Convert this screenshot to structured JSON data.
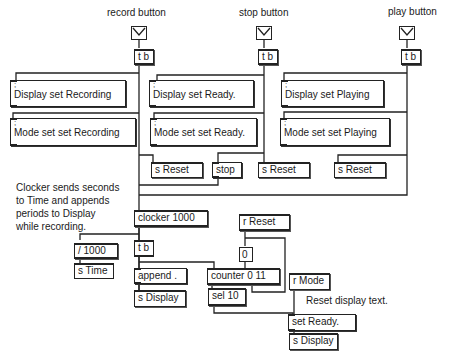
{
  "labels": {
    "record": "record  button",
    "stop": "stop  button",
    "play": "play  button"
  },
  "comments": {
    "clocker_note": [
      "Clocker sends seconds",
      "to Time and appends",
      "periods to Display",
      "while  recording."
    ],
    "reset_note": "Reset  display  text."
  },
  "objects": {
    "tb_record": "t b",
    "tb_stop": "t b",
    "tb_play": "t b",
    "sreset_1": "s Reset",
    "stop_msg": "stop",
    "sreset_2": "s Reset",
    "sreset_3": "s Reset",
    "clocker": "clocker  1000",
    "div": "/   1000",
    "stime": "s Time",
    "tb_clock": "t b",
    "append": "append .",
    "sdisplay_1": "s  Display",
    "rreset": "r  Reset",
    "zero": "0",
    "counter": "counter  0  11",
    "sel": "sel  10",
    "rmode": "r  Mode",
    "set_ready": "set  Ready.",
    "sdisplay_2": "s  Display"
  },
  "messages": {
    "disp_recording": [
      "Display  set  Recording"
    ],
    "mode_recording": [
      "Mode  set  set  Recording"
    ],
    "disp_ready": [
      "Display  set  Ready."
    ],
    "mode_ready": [
      "Mode  set  set  Ready."
    ],
    "disp_playing": [
      "Display  set  Playing"
    ],
    "mode_playing": [
      "Mode  set  set  Playing"
    ],
    "semicolon": ";"
  }
}
